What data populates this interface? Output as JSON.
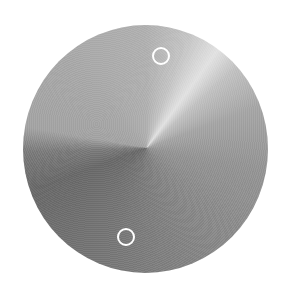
{
  "knob": {
    "shape": "circle",
    "style": "brushed-metal conic gradient",
    "colors": {
      "highlight": "#e2e2e2",
      "light": "#b0b0b0",
      "mid": "#8a8a8a",
      "dark": "#6a6a6a",
      "marker": "#ffffff"
    },
    "markers": [
      {
        "id": "top",
        "icon": "ring-marker-icon"
      },
      {
        "id": "bottom",
        "icon": "ring-marker-icon"
      }
    ]
  }
}
